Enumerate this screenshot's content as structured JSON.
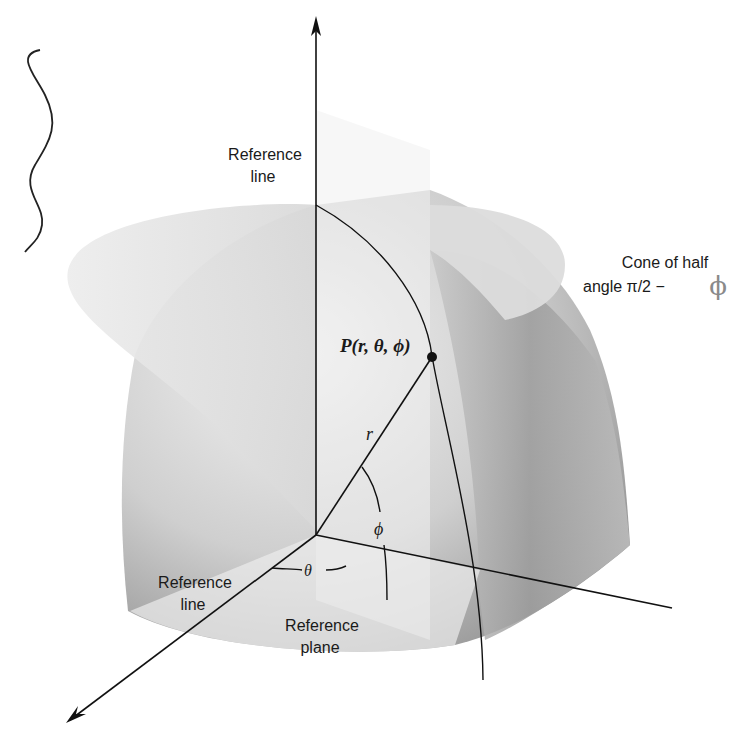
{
  "figure": {
    "labels": {
      "reference_line_top_1": "Reference",
      "reference_line_top_2": "line",
      "cone_1": "Cone of half",
      "cone_2": "angle π/2 − ",
      "cone_phi_handwritten": "ϕ",
      "point": "P(r, θ, ϕ)",
      "radius": "r",
      "phi": "ϕ",
      "theta": "θ",
      "reference_line_bottom_1": "Reference",
      "reference_line_bottom_2": "line",
      "reference_plane_1": "Reference",
      "reference_plane_2": "plane"
    },
    "colors": {
      "ink": "#111111",
      "cone_fill": "#e4e4e4",
      "sphere_light": "#e9e9e9",
      "sphere_dark": "#9a9a9a",
      "plane_fill": "#ededed",
      "annotation_gray": "#8a8a8a"
    }
  }
}
